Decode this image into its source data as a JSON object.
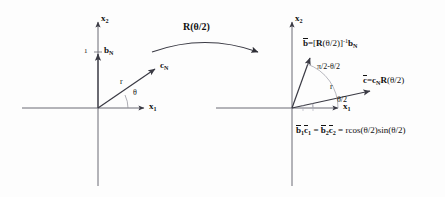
{
  "figure": {
    "type": "vector-rotation-diagram",
    "background_color": "#fdfdfd",
    "stroke_color": "#5a5a66",
    "text_color": "#111111"
  },
  "left_panel": {
    "name": "original-frame",
    "origin": {
      "x": 98,
      "y": 108
    },
    "axes": {
      "x_label": "x",
      "x_sub": "1",
      "y_label": "x",
      "y_sub": "2"
    },
    "tick": {
      "value": "1",
      "y": 52
    },
    "vectors": [
      {
        "name": "b_N",
        "label": "b",
        "sub": "N",
        "tip": {
          "x": 98,
          "y": 52
        }
      },
      {
        "name": "c_N",
        "label": "c",
        "sub": "N",
        "tip": {
          "x": 158,
          "y": 67
        }
      }
    ],
    "annotations": {
      "radius": "r",
      "angle": "θ"
    }
  },
  "rotation_arrow": {
    "name": "rotation-operator",
    "label": "R(θ/2)"
  },
  "right_panel": {
    "name": "rotated-frame",
    "origin": {
      "x": 292,
      "y": 108
    },
    "axes": {
      "x_label": "x",
      "x_sub": "1",
      "y_label": "x",
      "y_sub": "2"
    },
    "vectors": [
      {
        "name": "b-bar",
        "equation_parts": {
          "lhs": "b",
          "eq": "=[",
          "op": "R",
          "arg": "(θ/2)]",
          "inv": "-1",
          "rhs": "b",
          "rhs_sub": "N"
        },
        "tip": {
          "x": 308,
          "y": 56
        }
      },
      {
        "name": "c-bar",
        "equation_parts": {
          "lhs": "c",
          "eq": "=",
          "rhs": "c",
          "rhs_sub": "N",
          "op": "R",
          "arg": "(θ/2)"
        },
        "tip": {
          "x": 373,
          "y": 90
        }
      }
    ],
    "annotations": {
      "angle_upper": "π/2-θ/2",
      "angle_lower": "θ/2",
      "radius": "r"
    },
    "identity": {
      "b1": "b",
      "b1_sub": "1",
      "c1": "c",
      "c1_sub": "1",
      "eq1": " = ",
      "b2": "b",
      "b2_sub": "2",
      "c2": "c",
      "c2_sub": "2",
      "eq2": " = ",
      "rhs": "rcos(θ/2)sin(θ/2)"
    }
  }
}
